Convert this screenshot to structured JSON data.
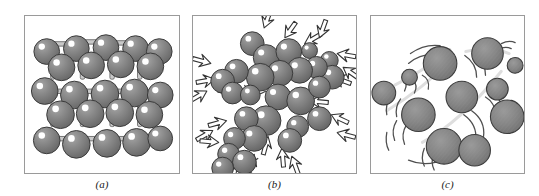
{
  "figure": {
    "background_color": "#ffffff",
    "panel_border_color": "#9a9a9a"
  },
  "palette": {
    "sphere_fill": "#808080",
    "sphere_fill_dark": "#6e6e6e",
    "sphere_outline": "#3a3a3a",
    "sphere_highlight": "#ffffff",
    "bond_fill": "#c9c9c9",
    "bond_outline": "#5a5a5a",
    "arrow_fill": "#ffffff",
    "arrow_outline": "#333333",
    "motion_arc": "#555555",
    "caption_color": "#1a1a1a"
  },
  "panels": [
    {
      "id": "a",
      "caption": "(a)",
      "state": "solid",
      "description": "Ordered cubic crystal lattice of spheres joined by rigid bonds",
      "particle_count": 30,
      "has_bonds": true,
      "has_arrows": false,
      "has_motion_arcs": false
    },
    {
      "id": "b",
      "caption": "(b)",
      "state": "liquid",
      "description": "Close-packed disordered spheres with short outward motion arrows",
      "particle_count": 36,
      "has_bonds": false,
      "has_arrows": true,
      "has_motion_arcs": false
    },
    {
      "id": "c",
      "caption": "(c)",
      "state": "gas",
      "description": "Widely separated spheres with curved motion trail arcs",
      "particle_count": 11,
      "has_bonds": false,
      "has_arrows": false,
      "has_motion_arcs": true
    }
  ],
  "captions": {
    "a": "(a)",
    "b": "(b)",
    "c": "(c)"
  }
}
